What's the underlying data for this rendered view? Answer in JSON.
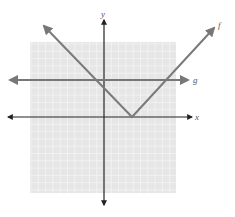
{
  "chart_data": {
    "type": "line",
    "title": "",
    "xlabel": "x",
    "ylabel": "y",
    "xlim": [
      -10,
      10
    ],
    "ylim": [
      -10,
      10
    ],
    "grid": true,
    "series": [
      {
        "name": "f",
        "expression": "f(x) = |x - 4|",
        "points": [
          [
            -6,
            10
          ],
          [
            4,
            0
          ],
          [
            14,
            10
          ]
        ],
        "vertex": [
          4,
          0
        ]
      },
      {
        "name": "g",
        "expression": "g(x) = 5",
        "points": [
          [
            -11,
            5
          ],
          [
            12,
            5
          ]
        ]
      }
    ],
    "intersections": [
      [
        -1,
        5
      ],
      [
        9,
        5
      ]
    ]
  },
  "labels": {
    "x_axis": "x",
    "y_axis": "y",
    "f_curve": "f",
    "g_line": "g"
  },
  "colors": {
    "grid_bg": "#e6e6e6",
    "grid_line": "#f4f4f4",
    "axis": "#222222",
    "curve": "#7a7a7a"
  }
}
